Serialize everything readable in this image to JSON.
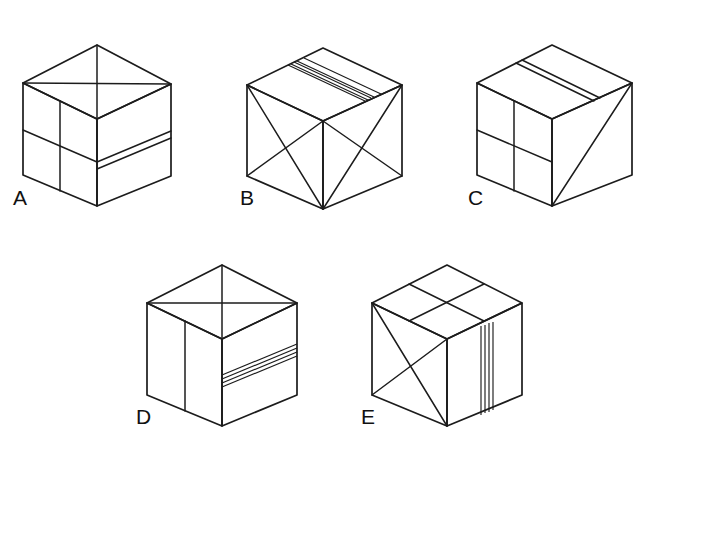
{
  "page": {
    "prompt_text_partial": "",
    "background_color": "#ffffff",
    "ink_color": "#1c1c1c"
  },
  "answer": {
    "label": "Answer:",
    "value": "",
    "box_empty": true
  },
  "options": [
    {
      "letter": "A",
      "top_face_pattern": "X diagonals plus horizontal midline",
      "left_face_pattern": "cross: vertical line and horizontal line",
      "right_face_pattern": "double horizontal stripe band"
    },
    {
      "letter": "B",
      "top_face_pattern": "four-line diagonal stripe band plus single parallel line",
      "left_face_pattern": "X diagonals",
      "right_face_pattern": "X diagonals"
    },
    {
      "letter": "C",
      "top_face_pattern": "double-line diagonal stripe band",
      "left_face_pattern": "cross: vertical line and horizontal line",
      "right_face_pattern": "single diagonal from bottom corner to top corner"
    },
    {
      "letter": "D",
      "top_face_pattern": "X diagonals plus horizontal midline",
      "left_face_pattern": "single vertical line",
      "right_face_pattern": "four-line stripe band"
    },
    {
      "letter": "E",
      "top_face_pattern": "cross grid of two midlines",
      "left_face_pattern": "X diagonals",
      "right_face_pattern": "four-line vertical stripe band"
    }
  ]
}
